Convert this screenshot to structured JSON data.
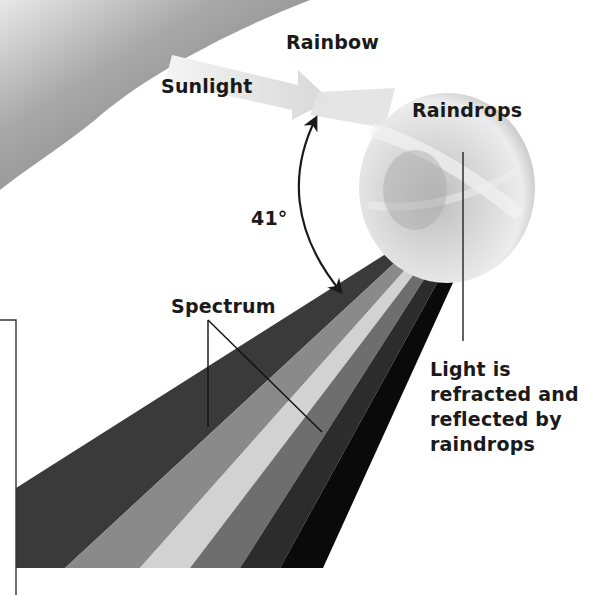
{
  "diagram": {
    "labels": {
      "rainbow": "Rainbow",
      "sunlight": "Sunlight",
      "raindrops": "Raindrops",
      "angle": "41°",
      "spectrum": "Spectrum",
      "explanation": "Light is refracted and reflected by raindrops"
    },
    "angle_degrees": 41,
    "spectrum_bands": 6,
    "colors": {
      "rainbow_arc": "#8c8c8c",
      "sunlight_beam": "#e6e6e6",
      "raindrop": "#dcdcdc",
      "text": "#1a1a1a",
      "leader_line": "#222222",
      "spectrum": [
        "#3a3a3a",
        "#8a8a8a",
        "#d2d2d2",
        "#6e6e6e",
        "#2c2c2c",
        "#0a0a0a"
      ]
    }
  }
}
